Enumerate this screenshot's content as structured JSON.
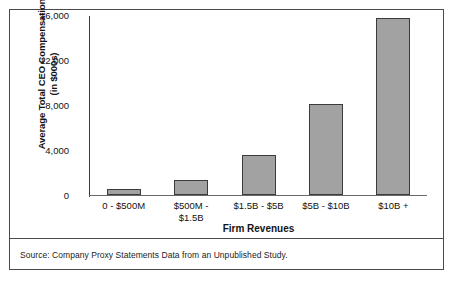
{
  "chart_data": {
    "type": "bar",
    "title": "",
    "xlabel": "Firm Revenues",
    "ylabel_line1": "Average Total CEO Compensation",
    "ylabel_line2": "(in $000s)",
    "categories": [
      "0 - $500M",
      "$500M - $1.5B",
      "$1.5B - $5B",
      "$5B - $10B",
      "$10B +"
    ],
    "category_lines": [
      {
        "line1": "0 - $500M",
        "line2": ""
      },
      {
        "line1": "$500M -",
        "line2": "$1.5B"
      },
      {
        "line1": "$1.5B - $5B",
        "line2": ""
      },
      {
        "line1": "$5B - $10B",
        "line2": ""
      },
      {
        "line1": "$10B +",
        "line2": ""
      }
    ],
    "values": [
      500,
      1300,
      3600,
      8100,
      15700
    ],
    "ylim": [
      0,
      16000
    ],
    "yticks": [
      16000,
      12000,
      8000,
      4000,
      0
    ],
    "ytick_labels": [
      "16,000",
      "12,000",
      "8,000",
      "4,000",
      "0"
    ],
    "grid": false,
    "legend": "none",
    "bar_color": "#a2a2a2",
    "bar_border_color": "#3b3b3b"
  },
  "source": {
    "note": "Source: Company Proxy Statements Data from an Unpublished Study."
  }
}
